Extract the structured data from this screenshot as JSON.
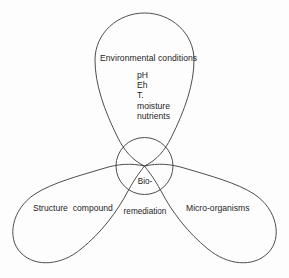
{
  "diagram": {
    "title_text": "Bioremediation factors Venn-style teardrop diagram",
    "center": {
      "name": "bio-remediation",
      "line1": "Bio-",
      "line2": "remediation"
    },
    "lobes": {
      "top": {
        "label": "Environmental conditions",
        "factors": [
          "pH",
          "Eh",
          "T.",
          "moisture",
          "nutrients"
        ]
      },
      "bottom_left": {
        "label": "Structure  compound"
      },
      "bottom_right": {
        "label": "Micro-organisms"
      }
    },
    "colors": {
      "stroke": "#3a3a3a",
      "text": "#1d1d1d",
      "background": "#fdfdfd"
    }
  }
}
